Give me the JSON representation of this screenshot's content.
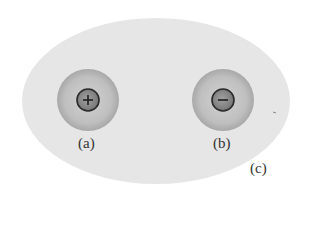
{
  "diagram": {
    "type": "charge-diagram",
    "region": {
      "label": "(c)",
      "shape": "ellipse",
      "fill": "#e4e4e4"
    },
    "charges": [
      {
        "label": "(a)",
        "sign": "+",
        "symbol": "+",
        "halo_fill": "#bdbdbd",
        "core_fill": "#8a8a8a"
      },
      {
        "label": "(b)",
        "sign": "-",
        "symbol": "−",
        "halo_fill": "#bdbdbd",
        "core_fill": "#8a8a8a"
      }
    ]
  }
}
